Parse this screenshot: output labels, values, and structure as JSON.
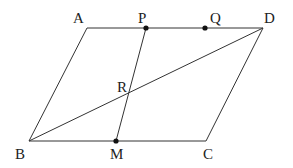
{
  "figure": {
    "type": "parallelogram-geometry",
    "stroke_color": "#333333",
    "point_color": "#111111",
    "label_color": "#222222"
  },
  "labels": {
    "A": "A",
    "P": "P",
    "Q": "Q",
    "D": "D",
    "R": "R",
    "B": "B",
    "M": "M",
    "C": "C"
  },
  "segments": [
    {
      "name": "side-AD",
      "from": "A",
      "to": "D"
    },
    {
      "name": "side-BC",
      "from": "B",
      "to": "C"
    },
    {
      "name": "side-AB",
      "from": "A",
      "to": "B"
    },
    {
      "name": "side-DC",
      "from": "D",
      "to": "C"
    },
    {
      "name": "diagonal-BD",
      "from": "B",
      "to": "D"
    },
    {
      "name": "segment-PM",
      "from": "P",
      "to": "M"
    }
  ],
  "marked_points": [
    "P",
    "Q",
    "M"
  ]
}
